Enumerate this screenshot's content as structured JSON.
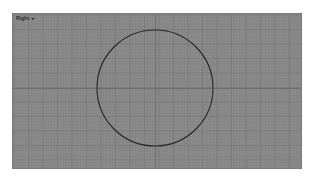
{
  "app": {
    "background_color": "#ffffff"
  },
  "viewport": {
    "label": "Right",
    "menu_arrow_icon": "chevron-down-icon",
    "background_color": "#8b8b8b",
    "grid_color": "#7a7a7a",
    "axis_color": "#6d6d6d",
    "geometry_color": "#272727",
    "bounds": {
      "x": 12,
      "y": 13,
      "width": 290,
      "height": 156
    },
    "grid": {
      "fine_spacing_px": 2.9,
      "major_spacing_px": 14.5,
      "visible": true
    },
    "axes": {
      "horizontal": {
        "y": 74,
        "visible": true
      },
      "vertical": {
        "x": 142,
        "visible": true
      }
    },
    "geometry": [
      {
        "type": "circle",
        "name": "circle-curve",
        "center_x": 142,
        "center_y": 74,
        "radius": 58
      }
    ]
  }
}
